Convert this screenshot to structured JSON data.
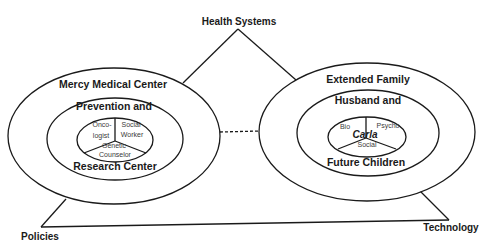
{
  "diagram": {
    "type": "ecological-systems-diagram",
    "triangle": {
      "apex_label": "Health Systems",
      "bottom_left_label": "Policies",
      "bottom_right_label": "Technology"
    },
    "left_system": {
      "outer_label": "Mercy Medical Center",
      "middle_label_top": "Prevention and",
      "middle_label_bottom": "Research Center",
      "sectors": {
        "top_left": "Onco-\nlogist",
        "top_left_line1": "Onco-",
        "top_left_line2": "logist",
        "top_right_line1": "Social",
        "top_right_line2": "Worker",
        "bottom_line1": "Genetic",
        "bottom_line2": "Counselor"
      }
    },
    "right_system": {
      "outer_label": "Extended Family",
      "middle_label_top": "Husband and",
      "middle_label_bottom": "Future Children",
      "center_name": "Carla",
      "sectors": {
        "top_left": "Bio",
        "top_right": "Psycho",
        "bottom": "Social"
      }
    },
    "connector": {
      "style": "dashed",
      "between": [
        "left_system",
        "right_system"
      ]
    },
    "colors": {
      "stroke": "#1a1a1a",
      "background": "#ffffff",
      "sector_text": "#3a3a3a"
    }
  }
}
